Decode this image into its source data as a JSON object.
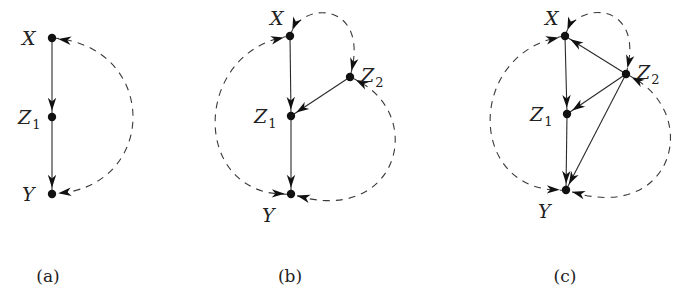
{
  "figure": {
    "panels": [
      {
        "id": "a",
        "caption": "(a)",
        "nodes": [
          {
            "id": "X",
            "label": "X",
            "sub": ""
          },
          {
            "id": "Z1",
            "label": "Z",
            "sub": "1"
          },
          {
            "id": "Y",
            "label": "Y",
            "sub": ""
          }
        ],
        "directed_edges": [
          {
            "from": "X",
            "to": "Z1"
          },
          {
            "from": "Z1",
            "to": "Y"
          }
        ],
        "bidirected_edges": [
          {
            "a": "X",
            "b": "Y"
          }
        ]
      },
      {
        "id": "b",
        "caption": "(b)",
        "nodes": [
          {
            "id": "X",
            "label": "X",
            "sub": ""
          },
          {
            "id": "Z1",
            "label": "Z",
            "sub": "1"
          },
          {
            "id": "Z2",
            "label": "Z",
            "sub": "2"
          },
          {
            "id": "Y",
            "label": "Y",
            "sub": ""
          }
        ],
        "directed_edges": [
          {
            "from": "X",
            "to": "Z1"
          },
          {
            "from": "Z2",
            "to": "Z1"
          },
          {
            "from": "Z1",
            "to": "Y"
          }
        ],
        "bidirected_edges": [
          {
            "a": "X",
            "b": "Z2"
          },
          {
            "a": "X",
            "b": "Y"
          },
          {
            "a": "Z2",
            "b": "Y"
          }
        ]
      },
      {
        "id": "c",
        "caption": "(c)",
        "nodes": [
          {
            "id": "X",
            "label": "X",
            "sub": ""
          },
          {
            "id": "Z1",
            "label": "Z",
            "sub": "1"
          },
          {
            "id": "Z2",
            "label": "Z",
            "sub": "2"
          },
          {
            "id": "Y",
            "label": "Y",
            "sub": ""
          }
        ],
        "directed_edges": [
          {
            "from": "X",
            "to": "Z1"
          },
          {
            "from": "Z2",
            "to": "X"
          },
          {
            "from": "Z2",
            "to": "Z1"
          },
          {
            "from": "Z2",
            "to": "Y"
          },
          {
            "from": "Z1",
            "to": "Y"
          }
        ],
        "bidirected_edges": [
          {
            "a": "X",
            "b": "Z2"
          },
          {
            "a": "X",
            "b": "Y"
          },
          {
            "a": "Z2",
            "b": "Y"
          }
        ]
      }
    ]
  }
}
